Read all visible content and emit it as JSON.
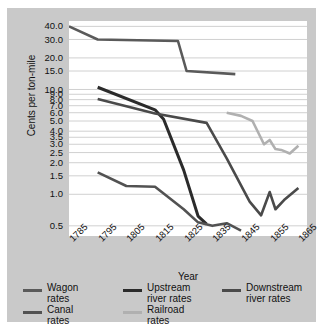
{
  "chart_data": {
    "type": "line",
    "title": "",
    "xlabel": "Year",
    "ylabel": "Cents per ton-mile",
    "yscale": "log",
    "ylim": [
      0.4,
      45
    ],
    "xlim": [
      1785,
      1868
    ],
    "grid": true,
    "legend_position": "bottom",
    "ytick_labels": [
      "40.0",
      "30.0",
      "20.0",
      "15.0",
      "10.0",
      "9.0",
      "8.0",
      "7.0",
      "6.0",
      "5.0",
      "4.0",
      "3.5",
      "3.0",
      "2.5",
      "2.0",
      "1.5",
      "1.0",
      "0.5"
    ],
    "ytick_values": [
      40.0,
      30.0,
      20.0,
      15.0,
      10.0,
      9.0,
      8.0,
      7.0,
      6.0,
      5.0,
      4.0,
      3.5,
      3.0,
      2.5,
      2.0,
      1.5,
      1.0,
      0.5
    ],
    "xtick_labels": [
      "1785",
      "1795",
      "1805",
      "1815",
      "1825",
      "1835",
      "1845",
      "1855",
      "1865"
    ],
    "xtick_values": [
      1785,
      1795,
      1805,
      1815,
      1825,
      1835,
      1845,
      1855,
      1865
    ],
    "series": [
      {
        "name": "Wagon rates",
        "color": "#5a5a5a",
        "width": 2.6,
        "x": [
          1785,
          1795,
          1823,
          1826,
          1843
        ],
        "values": [
          40.0,
          30.0,
          29.0,
          15.0,
          14.0
        ]
      },
      {
        "name": "Upstream river rates",
        "color": "#2b2b2b",
        "width": 3.0,
        "x": [
          1795,
          1815,
          1818,
          1825,
          1830,
          1833
        ],
        "values": [
          10.5,
          6.4,
          5.2,
          1.7,
          0.62,
          0.52
        ]
      },
      {
        "name": "Downstream river rates",
        "color": "#4a4a4a",
        "width": 2.6,
        "x": [
          1795,
          1815,
          1833,
          1840,
          1848,
          1852,
          1855,
          1857,
          1860,
          1865
        ],
        "values": [
          8.1,
          5.9,
          4.8,
          2.2,
          0.85,
          0.63,
          1.05,
          0.72,
          0.88,
          1.15
        ]
      },
      {
        "name": "Canal rates",
        "color": "#525252",
        "width": 2.6,
        "x": [
          1795,
          1805,
          1815,
          1825,
          1830,
          1835,
          1840,
          1845
        ],
        "values": [
          1.62,
          1.2,
          1.18,
          0.72,
          0.54,
          0.5,
          0.53,
          0.45
        ]
      },
      {
        "name": "Railroad rates",
        "color": "#b0b0b0",
        "width": 2.6,
        "x": [
          1840,
          1845,
          1849,
          1853,
          1855,
          1857,
          1859,
          1862,
          1865
        ],
        "values": [
          6.0,
          5.6,
          5.0,
          3.0,
          3.3,
          2.7,
          2.65,
          2.45,
          2.9
        ]
      }
    ]
  },
  "legend": {
    "items": [
      {
        "label_line1": "Wagon",
        "label_line2": "rates",
        "color": "#5a5a5a"
      },
      {
        "label_line1": "Upstream",
        "label_line2": "river rates",
        "color": "#2b2b2b"
      },
      {
        "label_line1": "Downstream",
        "label_line2": "river rates",
        "color": "#4a4a4a"
      },
      {
        "label_line1": "Canal",
        "label_line2": "rates",
        "color": "#525252"
      },
      {
        "label_line1": "Railroad",
        "label_line2": "rates",
        "color": "#b0b0b0"
      }
    ]
  },
  "colors": {
    "panel_background": "#c9c9c9",
    "plot_background": "#ffffff",
    "gridline": "#d0d0d0",
    "text": "#111111"
  }
}
